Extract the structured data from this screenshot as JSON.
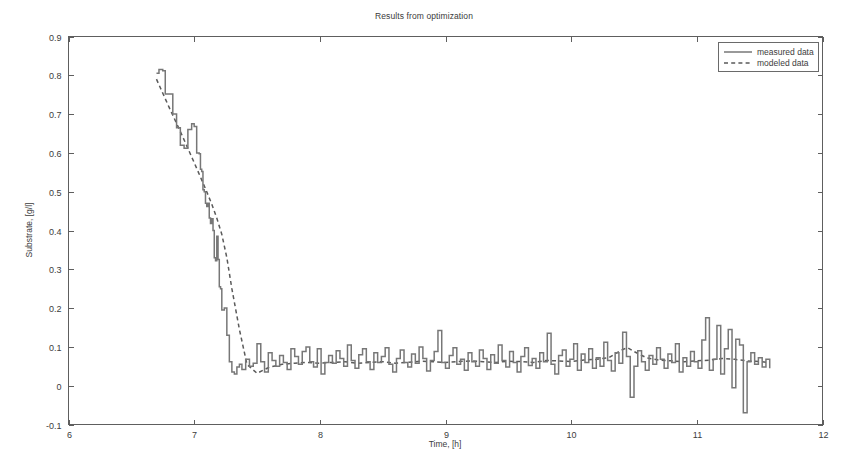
{
  "chart_data": {
    "type": "line",
    "title": "Results from optimization",
    "xlabel": "Time, [h]",
    "ylabel": "Substrate, [g/l]",
    "xlim": [
      6,
      12
    ],
    "ylim": [
      -0.1,
      0.9
    ],
    "xticks": [
      6,
      7,
      8,
      9,
      10,
      11,
      12
    ],
    "xtick_labels": [
      "6",
      "7",
      "8",
      "9",
      "10",
      "11",
      "12"
    ],
    "yticks": [
      -0.1,
      0,
      0.1,
      0.2,
      0.3,
      0.4,
      0.5,
      0.6,
      0.7,
      0.8,
      0.9
    ],
    "ytick_labels": [
      "-0.1",
      "0",
      "0.1",
      "0.2",
      "0.3",
      "0.4",
      "0.5",
      "0.6",
      "0.7",
      "0.8",
      "0.9"
    ],
    "grid": false,
    "legend_position": "top-right",
    "legend_entries": [
      {
        "name": "measured data",
        "style": "solid",
        "color": "#777777"
      },
      {
        "name": "modeled data",
        "style": "dashed",
        "color": "#5a5a5a"
      }
    ],
    "series": [
      {
        "name": "measured data",
        "style": "solid",
        "step": true,
        "x": [
          6.7,
          6.72,
          6.75,
          6.77,
          6.8,
          6.83,
          6.86,
          6.89,
          6.92,
          6.95,
          6.98,
          7.0,
          7.02,
          7.04,
          7.05,
          7.06,
          7.07,
          7.08,
          7.09,
          7.1,
          7.11,
          7.12,
          7.13,
          7.14,
          7.15,
          7.16,
          7.17,
          7.18,
          7.19,
          7.2,
          7.21,
          7.22,
          7.24,
          7.26,
          7.28,
          7.3,
          7.32,
          7.34,
          7.36,
          7.38,
          7.41,
          7.44,
          7.47,
          7.5,
          7.53,
          7.56,
          7.59,
          7.62,
          7.65,
          7.68,
          7.71,
          7.74,
          7.77,
          7.8,
          7.83,
          7.86,
          7.89,
          7.92,
          7.95,
          7.98,
          8.01,
          8.04,
          8.07,
          8.1,
          8.13,
          8.16,
          8.19,
          8.22,
          8.25,
          8.28,
          8.31,
          8.34,
          8.37,
          8.4,
          8.43,
          8.46,
          8.49,
          8.52,
          8.55,
          8.58,
          8.61,
          8.64,
          8.67,
          8.7,
          8.73,
          8.76,
          8.79,
          8.82,
          8.85,
          8.88,
          8.91,
          8.94,
          8.97,
          9.0,
          9.03,
          9.06,
          9.09,
          9.12,
          9.15,
          9.18,
          9.21,
          9.24,
          9.27,
          9.3,
          9.33,
          9.36,
          9.39,
          9.42,
          9.45,
          9.48,
          9.51,
          9.54,
          9.57,
          9.6,
          9.63,
          9.66,
          9.69,
          9.72,
          9.75,
          9.78,
          9.81,
          9.84,
          9.87,
          9.9,
          9.93,
          9.96,
          9.99,
          10.02,
          10.05,
          10.08,
          10.11,
          10.14,
          10.17,
          10.2,
          10.23,
          10.26,
          10.29,
          10.32,
          10.35,
          10.38,
          10.41,
          10.44,
          10.47,
          10.5,
          10.53,
          10.56,
          10.59,
          10.62,
          10.65,
          10.68,
          10.71,
          10.74,
          10.77,
          10.8,
          10.83,
          10.86,
          10.89,
          10.92,
          10.95,
          10.98,
          11.01,
          11.04,
          11.07,
          11.1,
          11.13,
          11.16,
          11.19,
          11.22,
          11.25,
          11.28,
          11.31,
          11.34,
          11.37,
          11.4,
          11.43,
          11.46,
          11.49,
          11.52,
          11.55,
          11.58
        ],
        "y": [
          0.805,
          0.815,
          0.812,
          0.752,
          0.752,
          0.7,
          0.665,
          0.62,
          0.612,
          0.66,
          0.675,
          0.668,
          0.6,
          0.598,
          0.558,
          0.552,
          0.505,
          0.5,
          0.47,
          0.462,
          0.47,
          0.432,
          0.418,
          0.43,
          0.4,
          0.33,
          0.322,
          0.385,
          0.325,
          0.255,
          0.25,
          0.195,
          0.2,
          0.13,
          0.062,
          0.035,
          0.03,
          0.048,
          0.055,
          0.042,
          0.068,
          0.05,
          0.058,
          0.108,
          0.062,
          0.035,
          0.085,
          0.065,
          0.05,
          0.078,
          0.06,
          0.042,
          0.095,
          0.075,
          0.055,
          0.088,
          0.1,
          0.062,
          0.048,
          0.095,
          0.03,
          0.06,
          0.078,
          0.058,
          0.09,
          0.07,
          0.05,
          0.105,
          0.065,
          0.045,
          0.08,
          0.095,
          0.062,
          0.042,
          0.085,
          0.06,
          0.075,
          0.098,
          0.055,
          0.035,
          0.07,
          0.092,
          0.06,
          0.048,
          0.082,
          0.058,
          0.1,
          0.07,
          0.038,
          0.065,
          0.088,
          0.142,
          0.06,
          0.045,
          0.078,
          0.098,
          0.055,
          0.068,
          0.04,
          0.085,
          0.062,
          0.05,
          0.092,
          0.07,
          0.042,
          0.08,
          0.058,
          0.105,
          0.065,
          0.048,
          0.088,
          0.06,
          0.035,
          0.075,
          0.098,
          0.052,
          0.07,
          0.045,
          0.085,
          0.062,
          0.135,
          0.055,
          0.03,
          0.078,
          0.092,
          0.05,
          0.068,
          0.108,
          0.04,
          0.082,
          0.06,
          0.095,
          0.045,
          0.072,
          0.05,
          0.112,
          0.065,
          0.038,
          0.085,
          0.058,
          0.138,
          0.075,
          -0.03,
          0.05,
          0.09,
          0.062,
          0.04,
          0.078,
          0.055,
          0.098,
          0.068,
          0.045,
          0.082,
          0.06,
          0.108,
          0.035,
          0.072,
          0.05,
          0.088,
          0.062,
          0.045,
          0.118,
          0.175,
          0.04,
          0.068,
          0.155,
          0.03,
          0.095,
          0.145,
          -0.005,
          0.12,
          0.105,
          -0.07,
          0.062,
          0.085,
          0.055,
          0.072,
          0.048,
          0.068,
          0.045
        ]
      },
      {
        "name": "modeled data",
        "style": "dashed",
        "step": false,
        "x": [
          6.7,
          6.8,
          6.9,
          7.0,
          7.05,
          7.1,
          7.14,
          7.18,
          7.22,
          7.26,
          7.3,
          7.36,
          7.42,
          7.5,
          7.6,
          7.7,
          7.8,
          7.9,
          8.0,
          8.1,
          8.2,
          8.3,
          8.4,
          8.5,
          8.6,
          8.7,
          8.8,
          8.9,
          9.0,
          9.1,
          9.2,
          9.3,
          9.4,
          9.5,
          9.6,
          9.7,
          9.8,
          9.9,
          10.0,
          10.1,
          10.2,
          10.3,
          10.4,
          10.45,
          10.5,
          10.6,
          10.7,
          10.8,
          10.9,
          11.0,
          11.1,
          11.2,
          11.3,
          11.4,
          11.5,
          11.58
        ],
        "y": [
          0.79,
          0.718,
          0.648,
          0.575,
          0.538,
          0.5,
          0.468,
          0.432,
          0.39,
          0.33,
          0.25,
          0.145,
          0.055,
          0.032,
          0.048,
          0.055,
          0.058,
          0.06,
          0.058,
          0.06,
          0.062,
          0.058,
          0.06,
          0.062,
          0.058,
          0.06,
          0.063,
          0.062,
          0.06,
          0.062,
          0.064,
          0.062,
          0.06,
          0.063,
          0.062,
          0.06,
          0.065,
          0.064,
          0.062,
          0.066,
          0.068,
          0.072,
          0.092,
          0.098,
          0.088,
          0.072,
          0.066,
          0.064,
          0.062,
          0.064,
          0.066,
          0.07,
          0.068,
          0.064,
          0.062,
          0.06
        ]
      }
    ]
  }
}
